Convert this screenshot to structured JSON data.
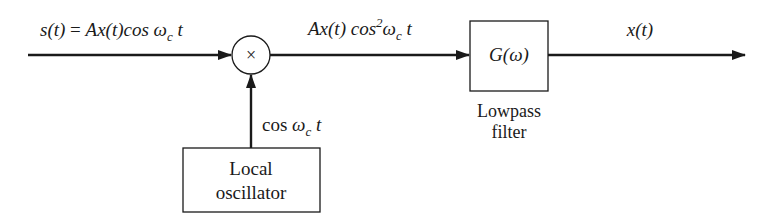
{
  "diagram": {
    "colors": {
      "stroke": "#1a1a1a",
      "background": "#ffffff"
    },
    "signals": {
      "input": {
        "lhs": "s(t)",
        "eq": " = ",
        "rhs_a": "Ax(t)cos ",
        "omega": "ω",
        "sub": "c",
        "t": " t"
      },
      "mixer_output": {
        "a": "Ax(t) cos",
        "sup": "2",
        "omega": "ω",
        "sub": "c",
        "t": " t"
      },
      "oscillator_output": {
        "a": "cos ",
        "omega": "ω",
        "sub": "c",
        "t": " t"
      },
      "output": "x(t)"
    },
    "blocks": {
      "mixer": {
        "symbol": "×"
      },
      "filter": {
        "transfer": "G(ω)",
        "caption_line1": "Lowpass",
        "caption_line2": "filter"
      },
      "oscillator": {
        "line1": "Local",
        "line2": "oscillator"
      }
    }
  }
}
